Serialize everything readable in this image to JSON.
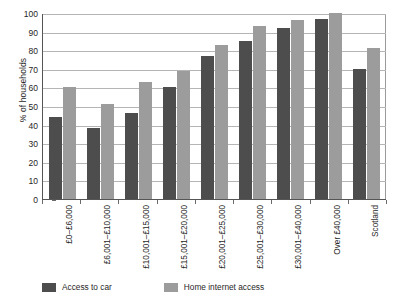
{
  "chart_data": {
    "type": "bar",
    "title": "",
    "xlabel": "",
    "ylabel": "% of households",
    "ylim": [
      0,
      100
    ],
    "ytick_step": 10,
    "yticks": [
      100,
      90,
      80,
      70,
      60,
      50,
      40,
      30,
      20,
      10,
      0
    ],
    "grid": true,
    "legend_position": "bottom-left",
    "categories": [
      "£0–£6,000",
      "£6,001–£10,000",
      "£10,001–£15,000",
      "£15,001–£20,000",
      "£20,001–£25,000",
      "£25,001–£30,000",
      "£30,001–£40,000",
      "Over £40,000",
      "Scotland"
    ],
    "series": [
      {
        "name": "Access to car",
        "color": "#4d4d4d",
        "values": [
          44,
          38,
          46,
          60,
          77,
          85,
          92,
          97,
          70
        ]
      },
      {
        "name": "Home internet access",
        "color": "#9c9c9c",
        "values": [
          60,
          51,
          63,
          69,
          83,
          93,
          96,
          100,
          81
        ]
      }
    ]
  }
}
